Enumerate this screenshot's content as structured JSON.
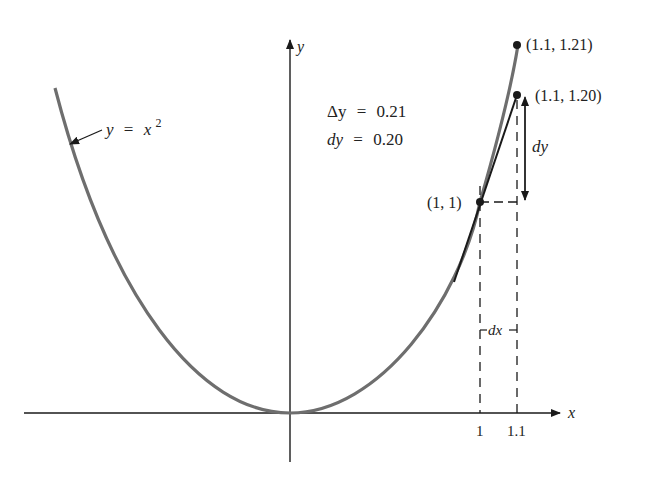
{
  "figure": {
    "curve_label": {
      "lhs": "y",
      "eq": "=",
      "base": "x",
      "exp": "2"
    },
    "axes": {
      "x_label": "x",
      "y_label": "y"
    },
    "annotations": {
      "delta_y": {
        "sym": "Δy",
        "eq": "=",
        "value": "0.21"
      },
      "dy": {
        "sym": "dy",
        "eq": "=",
        "value": "0.20"
      }
    },
    "points": [
      {
        "label": "(1, 1)"
      },
      {
        "label": "(1.1, 1.21)"
      },
      {
        "label": "(1.1, 1.20)"
      }
    ],
    "dy_label": "dy",
    "dx_label": "dx",
    "x_ticks": [
      "1",
      "1.1"
    ],
    "colors": {
      "curve": "#6e6e6e",
      "ink": "#1a1a1a"
    }
  }
}
